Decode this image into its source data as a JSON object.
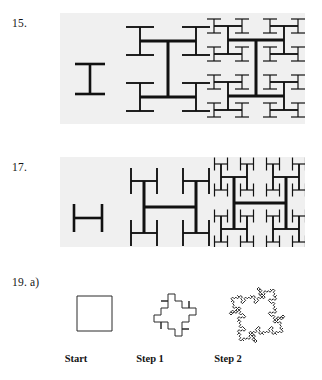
{
  "page": {
    "background_color": "#ffffff",
    "panel_color": "#f0f0f0",
    "ink_color": "#111111",
    "width": 322,
    "height": 380
  },
  "problems": [
    {
      "number_label": "15.",
      "figure_type": "h-tree-fractal-vertical",
      "stage_count": 3,
      "panel": {
        "x": 60,
        "y": 13,
        "width": 245,
        "height": 111
      },
      "stages": [
        {
          "name": "stage-0",
          "description": "single I bar"
        },
        {
          "name": "stage-1",
          "description": "H-tree iteration 1"
        },
        {
          "name": "stage-2",
          "description": "H-tree iteration 2"
        }
      ]
    },
    {
      "number_label": "17.",
      "figure_type": "h-tree-fractal-rotated",
      "stage_count": 3,
      "panel": {
        "x": 60,
        "y": 157,
        "width": 245,
        "height": 90
      },
      "stages": [
        {
          "name": "stage-0",
          "description": "single H bar"
        },
        {
          "name": "stage-1",
          "description": "rotated H-tree iteration 1"
        },
        {
          "name": "stage-2",
          "description": "rotated H-tree iteration 2"
        }
      ]
    },
    {
      "number_label": "19. a)",
      "figure_type": "quadratic-koch-island",
      "stage_count": 3,
      "stages": [
        {
          "name": "start",
          "caption": "Start",
          "description": "square"
        },
        {
          "name": "step-1",
          "caption": "Step 1",
          "description": "cross / plus polygon"
        },
        {
          "name": "step-2",
          "caption": "Step 2",
          "description": "quadratic koch diamond"
        }
      ]
    }
  ],
  "captions": {
    "start": "Start",
    "step1": "Step 1",
    "step2": "Step 2"
  },
  "numbers": {
    "fifteen": "15.",
    "seventeen": "17.",
    "nineteen": "19. a)"
  }
}
